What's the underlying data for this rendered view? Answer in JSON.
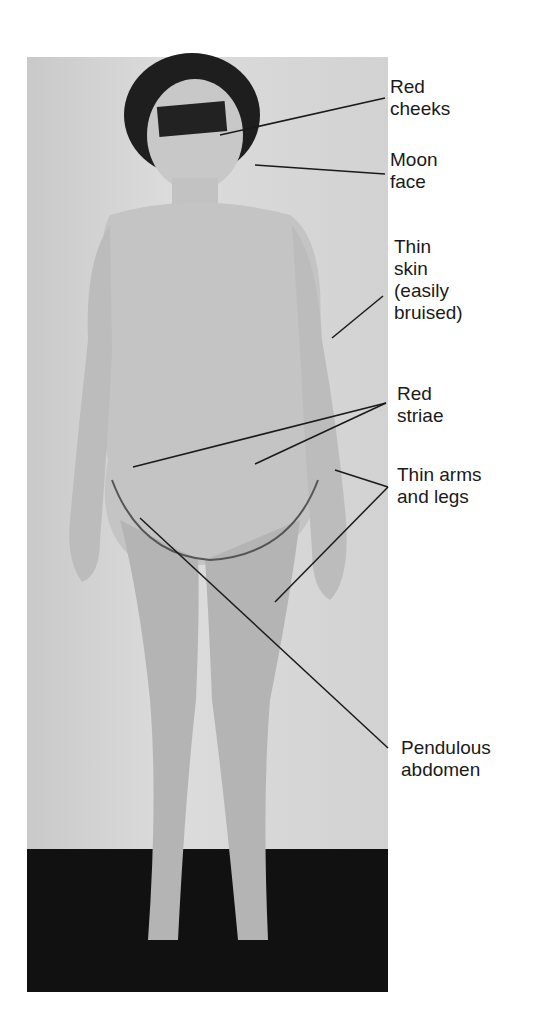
{
  "figure": {
    "type": "annotated clinical photograph",
    "colors": {
      "background": "#ffffff",
      "wall": "#d4d4d4",
      "floor": "#111111",
      "skin": "#bdbdbd",
      "hair": "#1e1e1e",
      "line": "#1a1a1a"
    }
  },
  "labels": [
    {
      "id": "red-cheeks",
      "text": "Red\ncheeks",
      "x": 390,
      "y": 76
    },
    {
      "id": "moon-face",
      "text": "Moon\nface",
      "x": 390,
      "y": 149
    },
    {
      "id": "thin-skin",
      "text": "Thin\nskin\n(easily\nbruised)",
      "x": 394,
      "y": 236
    },
    {
      "id": "red-striae",
      "text": "Red\nstriae",
      "x": 397,
      "y": 383
    },
    {
      "id": "thin-arms-legs",
      "text": "Thin arms\nand legs",
      "x": 397,
      "y": 464
    },
    {
      "id": "pendulous-abdomen",
      "text": "Pendulous\nabdomen",
      "x": 401,
      "y": 737
    }
  ]
}
